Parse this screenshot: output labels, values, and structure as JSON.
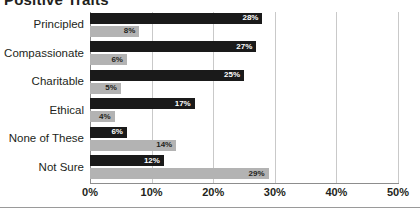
{
  "chart_data": {
    "type": "bar",
    "orientation": "horizontal",
    "title": "Positive Traits",
    "xlabel": "",
    "ylabel": "",
    "xlim": [
      0,
      50
    ],
    "xticks": [
      "0%",
      "10%",
      "20%",
      "30%",
      "40%",
      "50%"
    ],
    "xtick_values": [
      0,
      10,
      20,
      30,
      40,
      50
    ],
    "grid": true,
    "legend": null,
    "categories": [
      "Principled",
      "Compassionate",
      "Charitable",
      "Ethical",
      "None of These",
      "Not Sure"
    ],
    "series": [
      {
        "name": "Series 1",
        "color": "#1a1a1a",
        "values": [
          28,
          27,
          25,
          17,
          6,
          12
        ],
        "labels": [
          "28%",
          "27%",
          "25%",
          "17%",
          "6%",
          "12%"
        ]
      },
      {
        "name": "Series 2",
        "color": "#b3b3b3",
        "values": [
          8,
          6,
          5,
          4,
          14,
          29
        ],
        "labels": [
          "8%",
          "6%",
          "5%",
          "4%",
          "14%",
          "29%"
        ]
      }
    ]
  }
}
